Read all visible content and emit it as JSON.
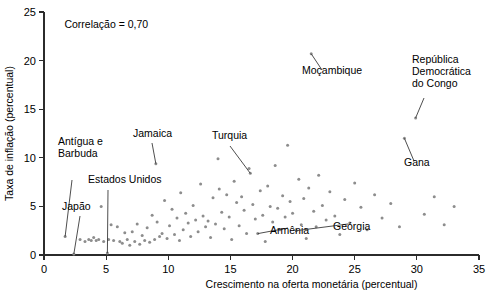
{
  "chart_data": {
    "type": "scatter",
    "title": "",
    "xlabel": "Crescimento na oferta monetária (percentual)",
    "ylabel": "Taxa de inflação (percentual)",
    "xlim": [
      0,
      35
    ],
    "ylim": [
      0,
      25
    ],
    "xticks": [
      0,
      5,
      10,
      15,
      20,
      25,
      30,
      35
    ],
    "yticks": [
      0,
      5,
      10,
      15,
      20,
      25
    ],
    "grid": false,
    "legend": null,
    "marker_color": "#8d8d8d",
    "annotations": [
      {
        "text": "Correlação = 0,70",
        "x": 1.0,
        "y": 23.4,
        "leader": false
      }
    ],
    "callouts": [
      {
        "label": "Antígua e Barbuda",
        "label_lines": [
          "Antígua e",
          "Barbuda"
        ],
        "point_x": 1.7,
        "point_y": 1.9
      },
      {
        "label": "Japão",
        "label_lines": [
          "Japão"
        ],
        "point_x": 2.4,
        "point_y": 0.1
      },
      {
        "label": "Estados Unidos",
        "label_lines": [
          "Estados Unidos"
        ],
        "point_x": 5.1,
        "point_y": 0.2
      },
      {
        "label": "Jamaica",
        "label_lines": [
          "Jamaica"
        ],
        "point_x": 9.0,
        "point_y": 9.4
      },
      {
        "label": "Turquia",
        "label_lines": [
          "Turquia"
        ],
        "point_x": 16.6,
        "point_y": 8.4
      },
      {
        "label": "Moçambique",
        "label_lines": [
          "Moçambique"
        ],
        "point_x": 21.5,
        "point_y": 20.7
      },
      {
        "label": "República Democrática do Congo",
        "label_lines": [
          "República",
          "Democrática",
          "do Congo"
        ],
        "point_x": 29.9,
        "point_y": 14.1
      },
      {
        "label": "Gana",
        "label_lines": [
          "Gana"
        ],
        "point_x": 29.0,
        "point_y": 12.0
      },
      {
        "label": "Armênia",
        "label_lines": [
          "Armênia"
        ],
        "point_x": 17.2,
        "point_y": 2.2
      },
      {
        "label": "Geórgia",
        "label_lines": [
          "Geórgia"
        ],
        "point_x": 20.3,
        "point_y": 2.5
      }
    ],
    "points": [
      [
        1.7,
        1.9
      ],
      [
        2.4,
        0.1
      ],
      [
        2.9,
        1.6
      ],
      [
        3.3,
        1.4
      ],
      [
        3.6,
        1.6
      ],
      [
        3.8,
        1.5
      ],
      [
        4.0,
        1.8
      ],
      [
        4.2,
        1.5
      ],
      [
        4.4,
        1.6
      ],
      [
        4.6,
        5.0
      ],
      [
        4.8,
        1.4
      ],
      [
        5.1,
        0.2
      ],
      [
        5.2,
        1.6
      ],
      [
        5.4,
        3.1
      ],
      [
        5.6,
        1.5
      ],
      [
        5.9,
        2.9
      ],
      [
        6.1,
        1.4
      ],
      [
        6.3,
        1.2
      ],
      [
        6.5,
        2.3
      ],
      [
        6.7,
        1.6
      ],
      [
        6.9,
        1.0
      ],
      [
        7.1,
        2.4
      ],
      [
        7.3,
        1.4
      ],
      [
        7.5,
        3.2
      ],
      [
        7.7,
        1.1
      ],
      [
        7.9,
        2.0
      ],
      [
        8.1,
        1.5
      ],
      [
        8.3,
        2.8
      ],
      [
        8.5,
        1.3
      ],
      [
        8.7,
        4.1
      ],
      [
        8.9,
        1.6
      ],
      [
        9.0,
        9.4
      ],
      [
        9.1,
        3.4
      ],
      [
        9.3,
        1.9
      ],
      [
        9.5,
        2.2
      ],
      [
        9.7,
        5.6
      ],
      [
        9.9,
        1.7
      ],
      [
        10.1,
        3.0
      ],
      [
        10.3,
        4.7
      ],
      [
        10.5,
        2.1
      ],
      [
        10.7,
        3.8
      ],
      [
        10.9,
        1.5
      ],
      [
        11.0,
        6.4
      ],
      [
        11.2,
        2.6
      ],
      [
        11.4,
        4.3
      ],
      [
        11.6,
        3.3
      ],
      [
        11.8,
        1.9
      ],
      [
        12.0,
        5.1
      ],
      [
        12.2,
        3.6
      ],
      [
        12.4,
        2.4
      ],
      [
        12.6,
        7.3
      ],
      [
        12.8,
        4.0
      ],
      [
        13.0,
        2.9
      ],
      [
        13.2,
        3.5
      ],
      [
        13.4,
        1.8
      ],
      [
        13.6,
        5.9
      ],
      [
        13.8,
        3.2
      ],
      [
        14.0,
        9.9
      ],
      [
        14.1,
        6.8
      ],
      [
        14.3,
        4.4
      ],
      [
        14.5,
        2.7
      ],
      [
        14.7,
        6.2
      ],
      [
        14.9,
        3.9
      ],
      [
        15.1,
        1.6
      ],
      [
        15.3,
        7.6
      ],
      [
        15.5,
        5.4
      ],
      [
        15.7,
        3.0
      ],
      [
        15.9,
        6.0
      ],
      [
        16.1,
        4.6
      ],
      [
        16.3,
        2.2
      ],
      [
        16.5,
        8.9
      ],
      [
        16.6,
        8.4
      ],
      [
        16.8,
        5.2
      ],
      [
        17.0,
        3.7
      ],
      [
        17.2,
        2.2
      ],
      [
        17.4,
        6.6
      ],
      [
        17.6,
        4.1
      ],
      [
        17.8,
        1.4
      ],
      [
        18.0,
        7.1
      ],
      [
        18.2,
        5.0
      ],
      [
        18.4,
        3.4
      ],
      [
        18.6,
        9.2
      ],
      [
        18.8,
        4.8
      ],
      [
        19.0,
        2.6
      ],
      [
        19.2,
        6.1
      ],
      [
        19.4,
        3.9
      ],
      [
        19.6,
        11.3
      ],
      [
        19.8,
        5.5
      ],
      [
        20.0,
        4.3
      ],
      [
        20.3,
        2.5
      ],
      [
        20.5,
        7.8
      ],
      [
        20.7,
        3.1
      ],
      [
        20.9,
        5.8
      ],
      [
        21.1,
        1.7
      ],
      [
        21.3,
        6.9
      ],
      [
        21.5,
        20.7
      ],
      [
        21.7,
        4.5
      ],
      [
        21.9,
        2.9
      ],
      [
        22.1,
        8.2
      ],
      [
        22.4,
        5.1
      ],
      [
        22.7,
        3.6
      ],
      [
        23.0,
        6.5
      ],
      [
        23.4,
        4.0
      ],
      [
        23.8,
        2.1
      ],
      [
        24.2,
        5.7
      ],
      [
        24.6,
        3.3
      ],
      [
        25.0,
        7.4
      ],
      [
        25.5,
        4.9
      ],
      [
        26.0,
        2.6
      ],
      [
        26.6,
        6.2
      ],
      [
        27.2,
        3.8
      ],
      [
        27.9,
        5.3
      ],
      [
        28.6,
        2.9
      ],
      [
        29.0,
        12.0
      ],
      [
        29.9,
        14.1
      ],
      [
        30.6,
        4.2
      ],
      [
        31.4,
        6.0
      ],
      [
        32.2,
        3.1
      ],
      [
        33.0,
        5.0
      ]
    ]
  }
}
